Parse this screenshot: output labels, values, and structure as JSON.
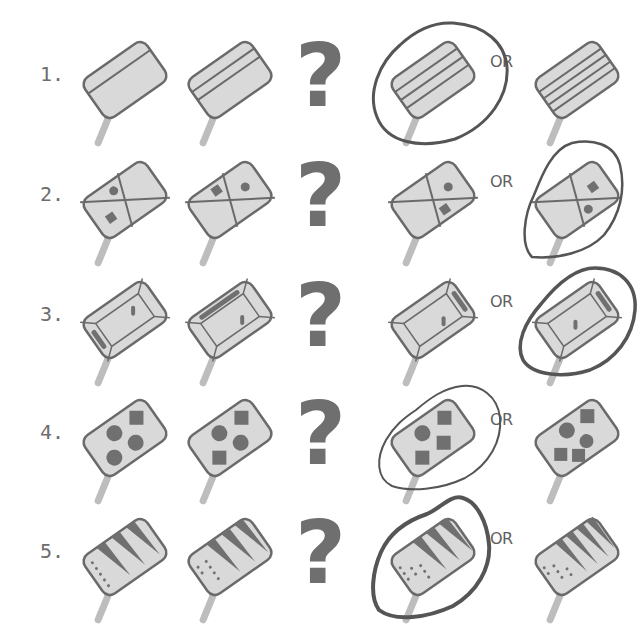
{
  "puzzle": {
    "or_label": "OR",
    "question_mark": "?",
    "colors": {
      "fill": "#d9d9d9",
      "outline": "#6a6a6a",
      "stick": "#bdbdbd",
      "mark": "#707070",
      "circle": "#555555"
    },
    "rows": [
      {
        "number": "1.",
        "pattern": "stripes",
        "sequence": [
          "1 stripe",
          "2 stripes"
        ],
        "options": [
          "3 stripes",
          "4 stripes"
        ],
        "selected_option": 0
      },
      {
        "number": "2.",
        "pattern": "quadrants",
        "sequence": [
          "circle top, square left",
          "square top, circle right"
        ],
        "options": [
          "circle right, square bottom",
          "square right, circle bottom"
        ],
        "selected_option": 1
      },
      {
        "number": "3.",
        "pattern": "box",
        "sequence": [
          "bar bottom-left",
          "bar top"
        ],
        "options": [
          "bar right",
          "bar right (shifted)"
        ],
        "selected_option": 1
      },
      {
        "number": "4.",
        "pattern": "shapes",
        "sequence": [
          "3 circles, 1 square",
          "2 circles, 2 squares"
        ],
        "options": [
          "1 circle, 3 squares",
          "2 circles, 3 squares"
        ],
        "selected_option": 0
      },
      {
        "number": "5.",
        "pattern": "triangles",
        "sequence": [
          "3 triangles, 1 dot row",
          "3 triangles, 2 dot rows"
        ],
        "options": [
          "3 triangles, 3 dot rows",
          "4 triangles, 3 dot rows"
        ],
        "selected_option": 0
      }
    ]
  }
}
